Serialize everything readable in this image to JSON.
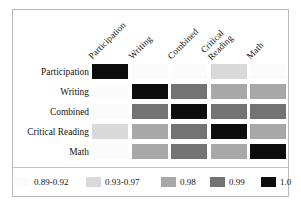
{
  "chart_data": {
    "type": "heatmap",
    "title": "",
    "xlabel": "",
    "ylabel": "",
    "categories": [
      "Participation",
      "Writing",
      "Combined",
      "Critical Reading",
      "Math"
    ],
    "x_tick_labels": [
      "Participation",
      "Writing",
      "Combined",
      "Critical Reading",
      "Math"
    ],
    "y_tick_labels": [
      "Participation",
      "Writing",
      "Combined",
      "Critical Reading",
      "Math"
    ],
    "grid": false,
    "legend_position": "bottom",
    "bins": [
      {
        "label": "0.89-0.92",
        "color": "#fbfbfb"
      },
      {
        "label": "0.93-0.97",
        "color": "#d9d9d9"
      },
      {
        "label": "0.98",
        "color": "#a8a8a8"
      },
      {
        "label": "0.99",
        "color": "#737373"
      },
      {
        "label": "1.0",
        "color": "#0d0d0d"
      }
    ],
    "rows": [
      {
        "label": "Participation",
        "cells": [
          {
            "column": "Participation",
            "bin": "1.0",
            "color": "#0d0d0d"
          },
          {
            "column": "Writing",
            "bin": "0.89-0.92",
            "color": "#fbfbfb"
          },
          {
            "column": "Combined",
            "bin": "0.89-0.92",
            "color": "#fbfbfb"
          },
          {
            "column": "Critical Reading",
            "bin": "0.93-0.97",
            "color": "#d9d9d9"
          },
          {
            "column": "Math",
            "bin": "0.89-0.92",
            "color": "#fbfbfb"
          }
        ]
      },
      {
        "label": "Writing",
        "cells": [
          {
            "column": "Participation",
            "bin": "0.89-0.92",
            "color": "#fbfbfb"
          },
          {
            "column": "Writing",
            "bin": "1.0",
            "color": "#0d0d0d"
          },
          {
            "column": "Combined",
            "bin": "0.99",
            "color": "#737373"
          },
          {
            "column": "Critical Reading",
            "bin": "0.98",
            "color": "#a8a8a8"
          },
          {
            "column": "Math",
            "bin": "0.98",
            "color": "#a8a8a8"
          }
        ]
      },
      {
        "label": "Combined",
        "cells": [
          {
            "column": "Participation",
            "bin": "0.89-0.92",
            "color": "#fbfbfb"
          },
          {
            "column": "Writing",
            "bin": "0.99",
            "color": "#737373"
          },
          {
            "column": "Combined",
            "bin": "1.0",
            "color": "#0d0d0d"
          },
          {
            "column": "Critical Reading",
            "bin": "0.99",
            "color": "#737373"
          },
          {
            "column": "Math",
            "bin": "0.99",
            "color": "#737373"
          }
        ]
      },
      {
        "label": "Critical Reading",
        "cells": [
          {
            "column": "Participation",
            "bin": "0.93-0.97",
            "color": "#d9d9d9"
          },
          {
            "column": "Writing",
            "bin": "0.98",
            "color": "#a8a8a8"
          },
          {
            "column": "Combined",
            "bin": "0.99",
            "color": "#737373"
          },
          {
            "column": "Critical Reading",
            "bin": "1.0",
            "color": "#0d0d0d"
          },
          {
            "column": "Math",
            "bin": "0.98",
            "color": "#a8a8a8"
          }
        ]
      },
      {
        "label": "Math",
        "cells": [
          {
            "column": "Participation",
            "bin": "0.89-0.92",
            "color": "#fbfbfb"
          },
          {
            "column": "Writing",
            "bin": "0.98",
            "color": "#a8a8a8"
          },
          {
            "column": "Combined",
            "bin": "0.99",
            "color": "#737373"
          },
          {
            "column": "Critical Reading",
            "bin": "0.98",
            "color": "#a8a8a8"
          },
          {
            "column": "Math",
            "bin": "1.0",
            "color": "#0d0d0d"
          }
        ]
      }
    ]
  },
  "figure": {
    "frame_color": "#b9b9b9",
    "background": "#ffffff",
    "legend_rule_color": "#c2c2c2"
  }
}
